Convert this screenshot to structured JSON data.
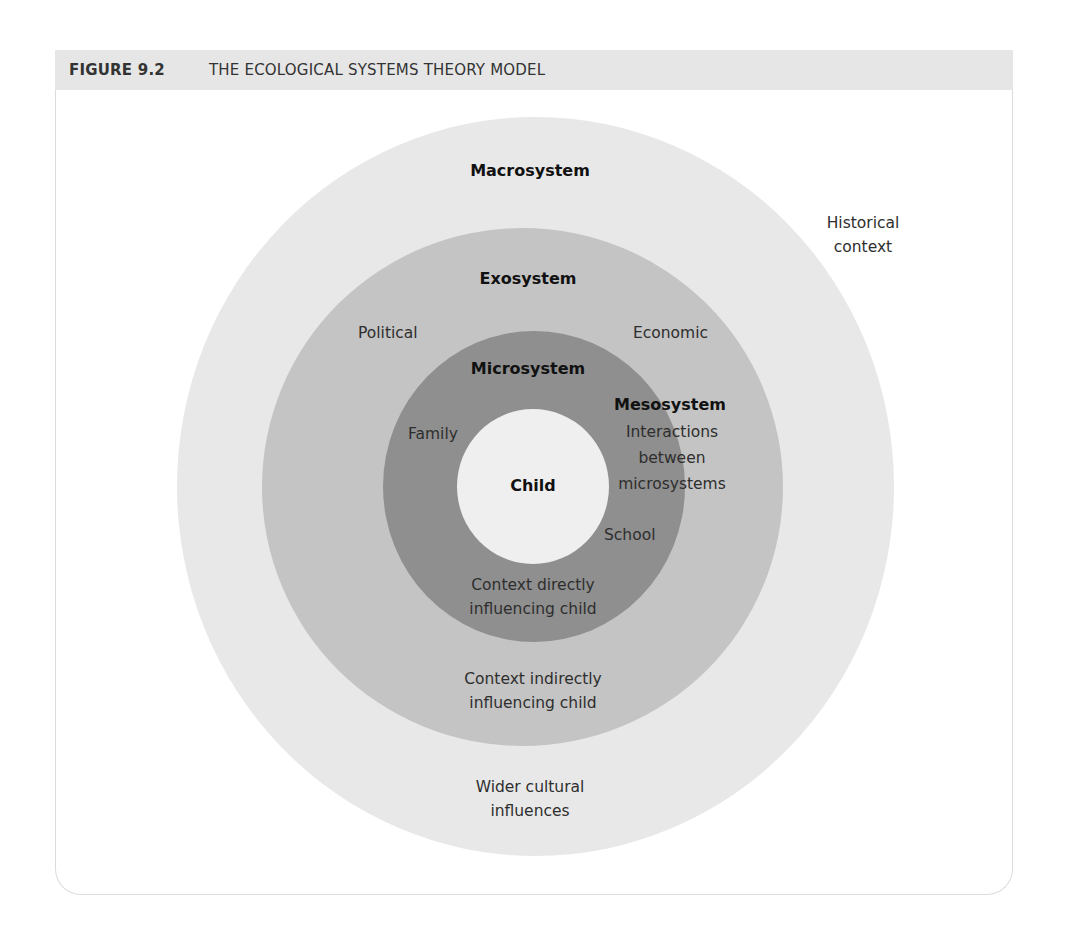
{
  "figure": {
    "number": "FIGURE 9.2",
    "title": "THE ECOLOGICAL SYSTEMS THEORY MODEL"
  },
  "colors": {
    "header_bg": "#e6e6e6",
    "macrosystem": "#e8e8e8",
    "exosystem": "#c4c4c4",
    "microsystem": "#8f8f8f",
    "child": "#efefef"
  },
  "diagram": {
    "outside": {
      "label_line1": "Historical",
      "label_line2": "context"
    },
    "macrosystem": {
      "title": "Macrosystem",
      "desc_line1": "Wider cultural",
      "desc_line2": "influences"
    },
    "exosystem": {
      "title": "Exosystem",
      "left_label": "Political",
      "right_label": "Economic",
      "desc_line1": "Context indirectly",
      "desc_line2": "influencing child"
    },
    "microsystem": {
      "title": "Microsystem",
      "left_label": "Family",
      "right_label": "School",
      "desc_line1": "Context directly",
      "desc_line2": "influencing child"
    },
    "mesosystem": {
      "title": "Mesosystem",
      "desc_line1": "Interactions",
      "desc_line2": "between",
      "desc_line3": "microsystems"
    },
    "child": {
      "label": "Child"
    }
  }
}
